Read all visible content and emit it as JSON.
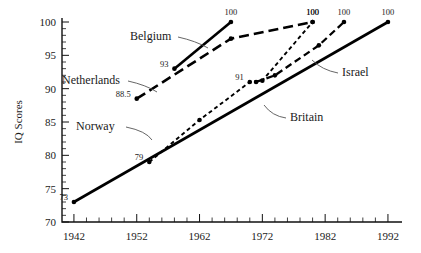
{
  "chart_data": {
    "type": "line",
    "title": "",
    "xlabel": "",
    "ylabel": "IQ Scores",
    "xlim": [
      1940,
      1994
    ],
    "ylim": [
      70,
      100
    ],
    "grid": false,
    "legend": "inline-annotations",
    "x_ticks": [
      "1942",
      "1952",
      "1962",
      "1972",
      "1982",
      "1992"
    ],
    "y_ticks": [
      "70",
      "75",
      "80",
      "85",
      "90",
      "95",
      "100"
    ],
    "x_tick_values": [
      1942,
      1952,
      1962,
      1972,
      1982,
      1992
    ],
    "y_tick_values": [
      70,
      75,
      80,
      85,
      90,
      95,
      100
    ],
    "x_minor_step": 2,
    "y_minor_step": 1,
    "series": [
      {
        "name": "Britain",
        "style": "solid",
        "label_text": "Britain",
        "x": [
          1942,
          1992
        ],
        "y": [
          73,
          100
        ],
        "point_labels": [
          "73",
          "100"
        ]
      },
      {
        "name": "Norway",
        "style": "short-dash",
        "label_text": "Norway",
        "x": [
          1954,
          1962,
          1970,
          1972,
          1980
        ],
        "y": [
          79,
          85.3,
          91,
          91.2,
          100
        ],
        "point_labels": [
          "79",
          "",
          "91",
          "",
          "100"
        ]
      },
      {
        "name": "Netherlands",
        "style": "long-dash",
        "label_text": "Netherlands",
        "x": [
          1952,
          1967,
          1980
        ],
        "y": [
          88.5,
          97.5,
          100
        ],
        "point_labels": [
          "88.5",
          "",
          "100"
        ]
      },
      {
        "name": "Belgium",
        "style": "solid",
        "label_text": "Belgium",
        "x": [
          1958,
          1967
        ],
        "y": [
          93,
          100
        ],
        "point_labels": [
          "93",
          "100"
        ]
      },
      {
        "name": "Israel",
        "style": "medium-dash",
        "label_text": "Israel",
        "x": [
          1971,
          1974,
          1981,
          1985
        ],
        "y": [
          91,
          92,
          96.5,
          100
        ],
        "point_labels": [
          "",
          "",
          "",
          "100"
        ]
      }
    ],
    "annotations": [
      {
        "text": "Belgium",
        "for": "Belgium"
      },
      {
        "text": "Netherlands",
        "for": "Netherlands"
      },
      {
        "text": "Norway",
        "for": "Norway"
      },
      {
        "text": "Britain",
        "for": "Britain"
      },
      {
        "text": "Israel",
        "for": "Israel"
      }
    ]
  }
}
